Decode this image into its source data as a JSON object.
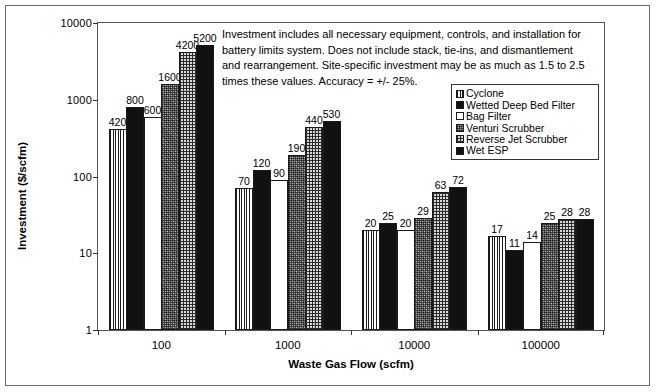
{
  "chart_data": {
    "type": "bar",
    "title": "",
    "xlabel": "Waste Gas Flow (scfm)",
    "ylabel": "Investment ($/scfm)",
    "yscale": "log",
    "ylim": [
      1,
      10000
    ],
    "yticks": [
      "1",
      "10",
      "100",
      "1000",
      "10000"
    ],
    "grid": false,
    "legend_position": "upper right",
    "categories": [
      "100",
      "1000",
      "10000",
      "100000"
    ],
    "series": [
      {
        "name": "Cyclone",
        "pattern": "vertical-lines",
        "values": [
          420,
          70,
          20,
          17
        ]
      },
      {
        "name": "Wetted Deep Bed Filter",
        "pattern": "solid-black",
        "values": [
          800,
          120,
          25,
          11
        ]
      },
      {
        "name": "Bag Filter",
        "pattern": "white",
        "values": [
          600,
          90,
          20,
          14
        ]
      },
      {
        "name": "Venturi Scrubber",
        "pattern": "speckle",
        "values": [
          1600,
          190,
          29,
          25
        ]
      },
      {
        "name": "Reverse Jet Scrubber",
        "pattern": "grid",
        "values": [
          4200,
          440,
          63,
          28
        ]
      },
      {
        "name": "Wet ESP",
        "pattern": "solid-black",
        "values": [
          5200,
          530,
          72,
          28
        ]
      }
    ],
    "annotation": "Investment includes all necessary equipment, controls, and installation for battery limits system.  Does not include stack, tie-ins, and dismantlement and rearrangement.  Site-specific investment may be as much as 1.5 to 2.5 times these values.  Accuracy = +/- 25%."
  }
}
